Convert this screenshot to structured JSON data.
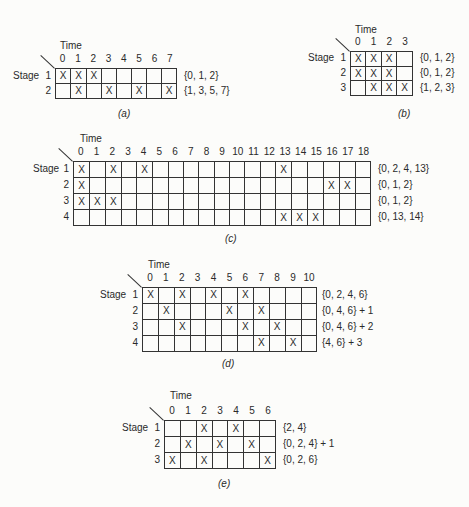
{
  "labels": {
    "time": "Time",
    "stage": "Stage"
  },
  "chart_data": [
    {
      "type": "table",
      "id": "a",
      "caption": "(a)",
      "columns": [
        "0",
        "1",
        "2",
        "3",
        "4",
        "5",
        "6",
        "7"
      ],
      "rows": [
        {
          "stage": "1",
          "marks": [
            0,
            1,
            2
          ],
          "set": "{0, 1, 2}"
        },
        {
          "stage": "2",
          "marks": [
            1,
            3,
            5,
            7
          ],
          "set": "{1, 3, 5, 7}"
        }
      ],
      "layout": {
        "x": 55,
        "y": 68,
        "cw": 15.3,
        "rh": 15,
        "show_time": true,
        "time_x": 60,
        "time_y": 40,
        "stage_x": 13,
        "caption_x": 118,
        "caption_y": 108,
        "set_x": 184
      }
    },
    {
      "type": "table",
      "id": "b",
      "caption": "(b)",
      "columns": [
        "0",
        "1",
        "2",
        "3"
      ],
      "rows": [
        {
          "stage": "1",
          "marks": [
            0,
            1,
            2
          ],
          "set": "{0, 1, 2}"
        },
        {
          "stage": "2",
          "marks": [
            0,
            1,
            2
          ],
          "set": "{0, 1, 2}"
        },
        {
          "stage": "3",
          "marks": [
            1,
            2,
            3
          ],
          "set": "{1, 2, 3}"
        }
      ],
      "layout": {
        "x": 350,
        "y": 51,
        "cw": 15.7,
        "rh": 14.7,
        "show_time": true,
        "time_x": 355,
        "time_y": 24,
        "stage_x": 308,
        "caption_x": 398,
        "caption_y": 108,
        "set_x": 420
      }
    },
    {
      "type": "table",
      "id": "c",
      "caption": "(c)",
      "columns": [
        "0",
        "1",
        "2",
        "3",
        "4",
        "5",
        "6",
        "7",
        "8",
        "9",
        "10",
        "11",
        "12",
        "13",
        "14",
        "15",
        "16",
        "17",
        "18"
      ],
      "rows": [
        {
          "stage": "1",
          "marks": [
            0,
            2,
            4,
            13
          ],
          "set": "{0, 2, 4, 13}"
        },
        {
          "stage": "2",
          "marks": [
            0,
            16,
            17
          ],
          "set": "{0, 1, 2}"
        },
        {
          "stage": "3",
          "marks": [
            0,
            1,
            2
          ],
          "set": "{0, 1, 2}"
        },
        {
          "stage": "4",
          "marks": [
            13,
            14,
            15
          ],
          "set": "{0, 13, 14}"
        }
      ],
      "layout": {
        "x": 73,
        "y": 161,
        "cw": 15.7,
        "rh": 16,
        "show_time": true,
        "time_x": 80,
        "time_y": 133,
        "stage_x": 33,
        "caption_x": 225,
        "caption_y": 233,
        "set_x": 378
      }
    },
    {
      "type": "table",
      "id": "d",
      "caption": "(d)",
      "columns": [
        "0",
        "1",
        "2",
        "3",
        "4",
        "5",
        "6",
        "7",
        "8",
        "9",
        "10"
      ],
      "rows": [
        {
          "stage": "1",
          "marks": [
            0,
            2,
            4,
            6
          ],
          "set": "{0, 2, 4, 6}"
        },
        {
          "stage": "2",
          "marks": [
            1,
            5,
            7
          ],
          "set": "{0, 4, 6} + 1"
        },
        {
          "stage": "3",
          "marks": [
            2,
            6,
            8
          ],
          "set": "{0, 4, 6} + 2"
        },
        {
          "stage": "4",
          "marks": [
            7,
            9
          ],
          "set": "{4, 6} + 3"
        }
      ],
      "layout": {
        "x": 142,
        "y": 287,
        "cw": 15.9,
        "rh": 15.9,
        "show_time": true,
        "time_x": 148,
        "time_y": 259,
        "stage_x": 100,
        "caption_x": 222,
        "caption_y": 358,
        "set_x": 322
      }
    },
    {
      "type": "table",
      "id": "e",
      "caption": "(e)",
      "columns": [
        "0",
        "1",
        "2",
        "3",
        "4",
        "5",
        "6"
      ],
      "rows": [
        {
          "stage": "1",
          "marks": [
            2,
            4
          ],
          "set": "{2, 4}"
        },
        {
          "stage": "2",
          "marks": [
            1,
            3,
            5
          ],
          "set": "{0, 2, 4} + 1"
        },
        {
          "stage": "3",
          "marks": [
            0,
            2,
            6
          ],
          "set": "{0, 2, 6}"
        }
      ],
      "layout": {
        "x": 164,
        "y": 420,
        "cw": 16,
        "rh": 16,
        "show_time": true,
        "time_x": 170,
        "time_y": 390,
        "stage_x": 122,
        "caption_x": 218,
        "caption_y": 478,
        "set_x": 283
      }
    }
  ]
}
